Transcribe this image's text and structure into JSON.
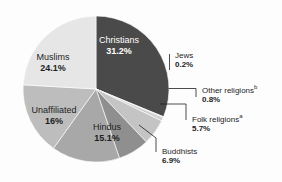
{
  "ghost_text": "",
  "chart_data": {
    "type": "pie",
    "title": "",
    "xlabel": "",
    "ylabel": "",
    "legend": "none",
    "grid": false,
    "categories": [
      "Christians",
      "Jews",
      "Other religions",
      "Folk religions",
      "Buddhists",
      "Hindus",
      "Unaffiliated",
      "Muslims"
    ],
    "values": [
      31.2,
      0.2,
      0.8,
      5.7,
      6.9,
      15.1,
      16.0,
      24.1
    ],
    "units": "percent",
    "slices": [
      {
        "name": "Christians",
        "value": 31.2,
        "value_label": "31.2%",
        "color": "#4a4a4a",
        "label_placement": "inside",
        "label_color": "light",
        "footnote": ""
      },
      {
        "name": "Jews",
        "value": 0.2,
        "value_label": "0.2%",
        "color": "#d9d9d9",
        "label_placement": "callout",
        "label_color": "dark",
        "footnote": ""
      },
      {
        "name": "Other religions",
        "value": 0.8,
        "value_label": "0.8%",
        "color": "#cfcfcf",
        "label_placement": "callout",
        "label_color": "dark",
        "footnote": "b"
      },
      {
        "name": "Folk religions",
        "value": 5.7,
        "value_label": "5.7%",
        "color": "#c4c4c4",
        "label_placement": "callout",
        "label_color": "dark",
        "footnote": "a"
      },
      {
        "name": "Buddhists",
        "value": 6.9,
        "value_label": "6.9%",
        "color": "#8f8f8f",
        "label_placement": "callout",
        "label_color": "dark",
        "footnote": ""
      },
      {
        "name": "Hindus",
        "value": 15.1,
        "value_label": "15.1%",
        "color": "#a8a8a8",
        "label_placement": "inside",
        "label_color": "dark",
        "footnote": ""
      },
      {
        "name": "Unaffiliated",
        "value": 16.0,
        "value_label": "16%",
        "color": "#bdbdbd",
        "label_placement": "inside",
        "label_color": "dark",
        "footnote": ""
      },
      {
        "name": "Muslims",
        "value": 24.1,
        "value_label": "24.1%",
        "color": "#e6e6e6",
        "label_placement": "inside",
        "label_color": "dark",
        "footnote": ""
      }
    ]
  },
  "inside_labels": {
    "christians": {
      "name": "Christians",
      "value": "31.2%"
    },
    "muslims": {
      "name": "Muslims",
      "value": "24.1%"
    },
    "unaffiliated": {
      "name": "Unaffiliated",
      "value": "16%"
    },
    "hindus": {
      "name": "Hindus",
      "value": "15.1%"
    }
  },
  "callouts": {
    "jews": {
      "name": "Jews",
      "value": "0.2%",
      "footnote": ""
    },
    "other_religions": {
      "name": "Other religions",
      "value": "0.8%",
      "footnote": "b"
    },
    "folk_religions": {
      "name": "Folk religions",
      "value": "5.7%",
      "footnote": "a"
    },
    "buddhists": {
      "name": "Buddhists",
      "value": "6.9%",
      "footnote": ""
    }
  }
}
